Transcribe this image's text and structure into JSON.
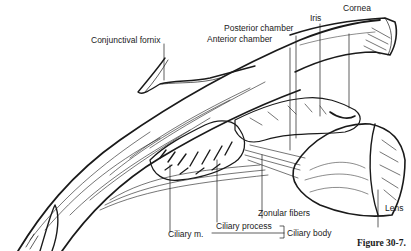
{
  "figure": {
    "caption": "Figure 30-7."
  },
  "labels": {
    "cornea": "Cornea",
    "iris": "Iris",
    "posterior_chamber": "Posterior chamber",
    "anterior_chamber": "Anterior chamber",
    "conjunctival_fornix": "Conjunctival fornix",
    "zonular_fibers": "Zonular fibers",
    "lens": "Lens",
    "ciliary_m": "Ciliary m.",
    "ciliary_process": "Ciliary process",
    "ciliary_body": "Ciliary body"
  },
  "colors": {
    "ink": "#1a1a1a",
    "background": "#ffffff"
  }
}
